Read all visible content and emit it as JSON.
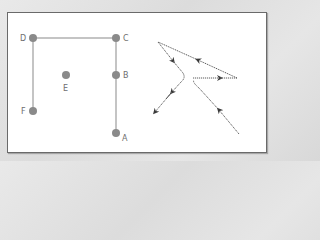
{
  "colors": {
    "point": "#8a8a8a",
    "grid_line": "#c0c0c0",
    "arrow_path": "#5a5a5a",
    "frame_border": "#6a6a6a",
    "label": "#6e6e6e"
  },
  "left_diagram": {
    "points": [
      {
        "label": "D",
        "x": 33,
        "y": 38
      },
      {
        "label": "C",
        "x": 116,
        "y": 38
      },
      {
        "label": "B",
        "x": 116,
        "y": 75
      },
      {
        "label": "E",
        "x": 66,
        "y": 75
      },
      {
        "label": "F",
        "x": 33,
        "y": 111
      },
      {
        "label": "A",
        "x": 116,
        "y": 133
      }
    ],
    "segments": [
      [
        "D",
        "C"
      ],
      [
        "D",
        "F"
      ],
      [
        "C",
        "A"
      ]
    ]
  },
  "right_diagram": {
    "description": "path with directional arrows",
    "style": "dotted lines with arrowheads"
  }
}
